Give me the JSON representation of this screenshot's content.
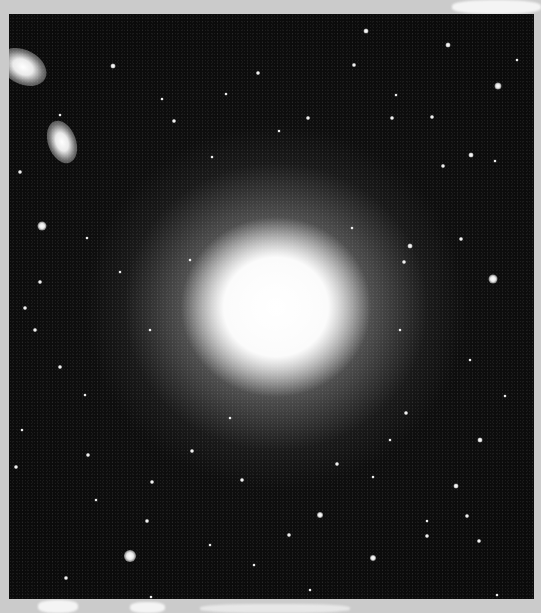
{
  "image": {
    "subject": "giant elliptical galaxy with surrounding globular clusters",
    "colors": {
      "border": "#cbcbcb",
      "sky": "#0b0b0b",
      "core": "#ffffff"
    },
    "core": {
      "cx": 267,
      "cy": 293,
      "rx": 95,
      "ry": 90
    },
    "companions": [
      {
        "x": -2,
        "y": 50,
        "w": 50,
        "h": 34,
        "rot": 28
      },
      {
        "x": 48,
        "y": 120,
        "w": 28,
        "h": 44,
        "rot": -20
      }
    ],
    "stars": [
      [
        42,
        226,
        9
      ],
      [
        130,
        556,
        12
      ],
      [
        493,
        279,
        9
      ],
      [
        66,
        578,
        4
      ],
      [
        113,
        66,
        5
      ],
      [
        354,
        65,
        4
      ],
      [
        366,
        31,
        5
      ],
      [
        448,
        45,
        5
      ],
      [
        498,
        86,
        7
      ],
      [
        471,
        155,
        5
      ],
      [
        20,
        172,
        4
      ],
      [
        40,
        282,
        4
      ],
      [
        25,
        308,
        4
      ],
      [
        35,
        330,
        4
      ],
      [
        60,
        367,
        4
      ],
      [
        16,
        467,
        4
      ],
      [
        88,
        455,
        4
      ],
      [
        152,
        482,
        4
      ],
      [
        147,
        521,
        4
      ],
      [
        242,
        480,
        4
      ],
      [
        320,
        515,
        6
      ],
      [
        373,
        558,
        6
      ],
      [
        456,
        486,
        5
      ],
      [
        467,
        516,
        4
      ],
      [
        427,
        536,
        4
      ],
      [
        479,
        541,
        4
      ],
      [
        497,
        595,
        3
      ],
      [
        410,
        246,
        5
      ],
      [
        404,
        262,
        4
      ],
      [
        461,
        239,
        4
      ],
      [
        406,
        413,
        4
      ],
      [
        480,
        440,
        5
      ],
      [
        258,
        73,
        4
      ],
      [
        226,
        94,
        3
      ],
      [
        174,
        121,
        4
      ],
      [
        162,
        99,
        3
      ],
      [
        308,
        118,
        4
      ],
      [
        392,
        118,
        4
      ],
      [
        432,
        117,
        4
      ],
      [
        443,
        166,
        4
      ],
      [
        495,
        161,
        3
      ],
      [
        396,
        95,
        3
      ],
      [
        279,
        131,
        3
      ],
      [
        212,
        157,
        3
      ],
      [
        60,
        115,
        3
      ],
      [
        87,
        238,
        3
      ],
      [
        192,
        451,
        4
      ],
      [
        289,
        535,
        4
      ],
      [
        337,
        464,
        4
      ],
      [
        373,
        477,
        3
      ],
      [
        427,
        521,
        3
      ],
      [
        210,
        545,
        3
      ],
      [
        151,
        597,
        3
      ],
      [
        85,
        395,
        3
      ],
      [
        230,
        418,
        3
      ],
      [
        390,
        440,
        3
      ],
      [
        505,
        396,
        3
      ],
      [
        517,
        60,
        3
      ],
      [
        190,
        260,
        3
      ],
      [
        400,
        330,
        3
      ],
      [
        150,
        330,
        3
      ],
      [
        96,
        500,
        3
      ],
      [
        254,
        565,
        3
      ],
      [
        310,
        590,
        3
      ],
      [
        22,
        430,
        3
      ],
      [
        120,
        272,
        3
      ],
      [
        470,
        360,
        3
      ],
      [
        352,
        228,
        3
      ]
    ]
  }
}
